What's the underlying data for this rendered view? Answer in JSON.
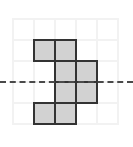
{
  "figure": {
    "background_color": "#ffffff",
    "width": 133,
    "height": 147
  },
  "grid": {
    "line_color": "#f2f2f2",
    "line_width": 2,
    "cell_size": 21,
    "origin_x": 12,
    "origin_y": 18,
    "columns": 5,
    "rows": 5,
    "vertical_line_x": [
      12,
      33,
      54,
      75,
      96,
      117
    ],
    "horizontal_line_y": [
      18,
      39,
      60,
      81,
      102,
      123
    ]
  },
  "shape": {
    "name": "polyomino",
    "cell_count": 8,
    "fill_color": "#d2d2d2",
    "stroke_color": "#333333",
    "stroke_width": 2,
    "cells": [
      {
        "col": 1,
        "row": 1,
        "x": 33,
        "y": 39
      },
      {
        "col": 2,
        "row": 1,
        "x": 54,
        "y": 39
      },
      {
        "col": 2,
        "row": 2,
        "x": 54,
        "y": 60
      },
      {
        "col": 3,
        "row": 2,
        "x": 75,
        "y": 60
      },
      {
        "col": 2,
        "row": 3,
        "x": 54,
        "y": 81
      },
      {
        "col": 3,
        "row": 3,
        "x": 75,
        "y": 81
      },
      {
        "col": 1,
        "row": 4,
        "x": 33,
        "y": 102
      },
      {
        "col": 2,
        "row": 4,
        "x": 54,
        "y": 102
      }
    ]
  },
  "symmetry_axis": {
    "name": "horizontal-dashed-line",
    "orientation": "horizontal",
    "y": 81,
    "x_start": 0,
    "x_end": 133,
    "color": "#4a4a4a",
    "style": "dashed",
    "width": 2
  }
}
